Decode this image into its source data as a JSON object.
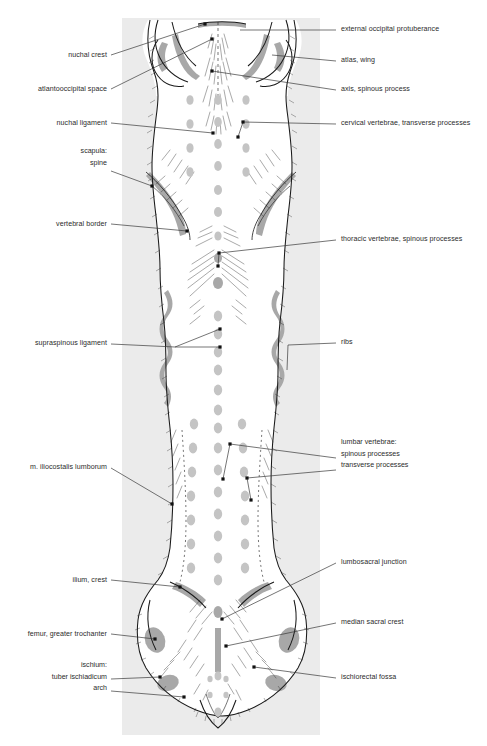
{
  "figure": {
    "panel": {
      "background_color": "#ebebeb",
      "x": 122,
      "y": 18,
      "width": 198,
      "height": 717
    },
    "colors": {
      "ink": "#1a1a1a",
      "leader_line": "#3a3a3a",
      "bone_highlight": "#a8a8a8",
      "palpation_dot": "#c4c4c4",
      "label_text": "#2b2b2b",
      "page_background": "#ffffff"
    }
  },
  "labels_left": [
    {
      "id": "nuchal-crest",
      "text": "nuchal crest",
      "x": 107,
      "y": 58,
      "leader": [
        [
          111,
          55
        ],
        [
          205,
          24
        ]
      ],
      "dot": true
    },
    {
      "id": "atlantooccipital-space",
      "text": "atlantooccipital space",
      "x": 107,
      "y": 92,
      "leader": [
        [
          111,
          89
        ],
        [
          212,
          39
        ]
      ],
      "dot": true
    },
    {
      "id": "nuchal-ligament",
      "text": "nuchal ligament",
      "x": 107,
      "y": 126,
      "leader": [
        [
          111,
          123
        ],
        [
          213,
          133
        ]
      ],
      "dot": true
    },
    {
      "id": "scapula-spine",
      "lines": [
        "scapula:",
        "spine"
      ],
      "x": 107,
      "y": 152,
      "leader": [
        [
          111,
          171
        ],
        [
          152,
          186
        ]
      ],
      "dot": true
    },
    {
      "id": "vertebral-border",
      "text": "vertebral border",
      "x": 107,
      "y": 227,
      "leader": [
        [
          111,
          224
        ],
        [
          187,
          231
        ]
      ],
      "dot": true
    },
    {
      "id": "supraspinous-ligament",
      "text": "supraspinous ligament",
      "x": 107,
      "y": 343,
      "leader": [
        [
          111,
          344
        ],
        [
          170,
          347
        ],
        [
          220,
          329
        ]
      ],
      "dot": true
    },
    {
      "id": "supraspinous-ligament-2",
      "text": "",
      "x": 0,
      "y": 0,
      "leader": [
        [
          170,
          347
        ],
        [
          220,
          347
        ]
      ],
      "dot": true
    },
    {
      "id": "m-iliocostalis-lumborum",
      "text": "m. iliocostalis lumborum",
      "x": 107,
      "y": 470,
      "leader": [
        [
          111,
          468
        ],
        [
          172,
          504
        ]
      ],
      "dot": true
    },
    {
      "id": "ilium-crest",
      "text": "ilium, crest",
      "x": 107,
      "y": 583,
      "leader": [
        [
          111,
          580
        ],
        [
          180,
          587
        ]
      ],
      "dot": true
    },
    {
      "id": "femur-greater-trochanter",
      "text": "femur, greater trochanter",
      "x": 107,
      "y": 637,
      "leader": [
        [
          111,
          634
        ],
        [
          155,
          639
        ]
      ],
      "dot": true
    },
    {
      "id": "ischium-group",
      "lines": [
        "ischium:",
        "tuber ischiadicum",
        "arch"
      ],
      "x": 107,
      "y": 664,
      "leader": [
        [
          111,
          679
        ],
        [
          160,
          677
        ]
      ],
      "dot": true
    },
    {
      "id": "ischium-arch",
      "text": "",
      "x": 0,
      "y": 0,
      "leader": [
        [
          111,
          691
        ],
        [
          182,
          697
        ]
      ],
      "dot": true
    }
  ],
  "labels_right": [
    {
      "id": "external-occipital-protuberance",
      "text": "external occipital protuberance",
      "x": 341,
      "y": 32,
      "leader": [
        [
          336,
          30
        ],
        [
          240,
          30
        ]
      ],
      "dot": false
    },
    {
      "id": "atlas-wing",
      "text": "atlas, wing",
      "x": 341,
      "y": 63,
      "leader": [
        [
          336,
          61
        ],
        [
          270,
          55
        ]
      ],
      "dot": false
    },
    {
      "id": "axis-spinous-process",
      "text": "axis, spinous process",
      "x": 341,
      "y": 92,
      "leader": [
        [
          336,
          90
        ],
        [
          212,
          71
        ]
      ],
      "dot": true
    },
    {
      "id": "cervical-vertebrae-transverse-processes",
      "text": "cervical vertebrae, transverse processes",
      "x": 341,
      "y": 126,
      "leader": [
        [
          336,
          124
        ],
        [
          243,
          122
        ]
      ],
      "dot": true
    },
    {
      "id": "cervical-vertebrae-2",
      "text": "",
      "x": 0,
      "y": 0,
      "leader": [
        [
          243,
          122
        ],
        [
          238,
          137
        ]
      ],
      "dot": true
    },
    {
      "id": "thoracic-vertebrae-spinous-processes",
      "text": "thoracic vertebrae, spinous processes",
      "x": 341,
      "y": 242,
      "leader": [
        [
          336,
          240
        ],
        [
          219,
          253
        ]
      ],
      "dot": true
    },
    {
      "id": "thoracic-vertebrae-2",
      "text": "",
      "x": 0,
      "y": 0,
      "leader": [
        [
          219,
          253
        ],
        [
          218,
          266
        ]
      ],
      "dot": true
    },
    {
      "id": "ribs",
      "text": "ribs",
      "x": 341,
      "y": 345,
      "leader": [
        [
          336,
          343
        ],
        [
          285,
          345
        ]
      ],
      "dot": false
    },
    {
      "id": "ribs-2",
      "text": "",
      "x": 0,
      "y": 0,
      "leader": [
        [
          285,
          345
        ],
        [
          287,
          368
        ]
      ],
      "dot": false
    },
    {
      "id": "lumbar-vertebrae-group",
      "lines": [
        "lumbar vertebrae:",
        "spinous processes",
        "transverse processes"
      ],
      "x": 341,
      "y": 441,
      "leader": [
        [
          336,
          458
        ],
        [
          230,
          444
        ]
      ],
      "dot": true
    },
    {
      "id": "lumbar-spinous-2",
      "text": "",
      "x": 0,
      "y": 0,
      "leader": [
        [
          230,
          444
        ],
        [
          223,
          479
        ]
      ],
      "dot": true
    },
    {
      "id": "lumbar-transverse",
      "text": "",
      "x": 0,
      "y": 0,
      "leader": [
        [
          336,
          470
        ],
        [
          247,
          478
        ]
      ],
      "dot": true
    },
    {
      "id": "lumbar-transverse-2",
      "text": "",
      "x": 0,
      "y": 0,
      "leader": [
        [
          247,
          478
        ],
        [
          251,
          500
        ]
      ],
      "dot": true
    },
    {
      "id": "lumbosacral-junction",
      "text": "lumbosacral junction",
      "x": 341,
      "y": 565,
      "leader": [
        [
          336,
          563
        ],
        [
          222,
          619
        ]
      ],
      "dot": true
    },
    {
      "id": "median-sacral-crest",
      "text": "median sacral crest",
      "x": 341,
      "y": 625,
      "leader": [
        [
          336,
          623
        ],
        [
          226,
          646
        ]
      ],
      "dot": true
    },
    {
      "id": "ischiorectal-fossa",
      "text": "ischiorectal fossa",
      "x": 341,
      "y": 680,
      "leader": [
        [
          336,
          678
        ],
        [
          254,
          667
        ]
      ],
      "dot": true
    }
  ],
  "palpation_dots": {
    "description": "Gray oval palpation markers over the vertebral column and paraspinal regions",
    "radius_x": 4.2,
    "radius_y": 5.4,
    "color": "#c4c4c4",
    "midline": [
      [
        218,
        100
      ],
      [
        218,
        119
      ],
      [
        218,
        140
      ],
      [
        218,
        160
      ],
      [
        218,
        183
      ],
      [
        218,
        203
      ],
      [
        218,
        226
      ],
      [
        218,
        248
      ],
      [
        218,
        270
      ],
      [
        218,
        292
      ],
      [
        218,
        312
      ],
      [
        218,
        330
      ],
      [
        218,
        347
      ],
      [
        218,
        366
      ],
      [
        218,
        385
      ],
      [
        218,
        404
      ],
      [
        218,
        424
      ],
      [
        218,
        443
      ],
      [
        218,
        462
      ],
      [
        218,
        481
      ],
      [
        218,
        500
      ],
      [
        218,
        520
      ],
      [
        218,
        540
      ],
      [
        218,
        560
      ],
      [
        218,
        580
      ],
      [
        218,
        600
      ],
      [
        218,
        620
      ],
      [
        218,
        640
      ],
      [
        218,
        660
      ],
      [
        218,
        678
      ],
      [
        218,
        694
      ],
      [
        218,
        712
      ]
    ],
    "left_column": [
      [
        190,
        100
      ],
      [
        190,
        123
      ],
      [
        190,
        146
      ],
      [
        190,
        170
      ],
      [
        195,
        424
      ],
      [
        193,
        444
      ],
      [
        192,
        466
      ],
      [
        191,
        488
      ],
      [
        191,
        510
      ],
      [
        191,
        532
      ],
      [
        191,
        554
      ]
    ],
    "right_column": [
      [
        246,
        100
      ],
      [
        246,
        123
      ],
      [
        246,
        146
      ],
      [
        246,
        170
      ],
      [
        244,
        424
      ],
      [
        245,
        444
      ],
      [
        246,
        466
      ],
      [
        247,
        488
      ],
      [
        247,
        510
      ],
      [
        247,
        532
      ],
      [
        247,
        538
      ]
    ],
    "small_pelvic": [
      [
        211,
        678
      ],
      [
        225,
        678
      ],
      [
        211,
        694
      ],
      [
        225,
        694
      ]
    ]
  },
  "bone_highlights": {
    "description": "Gray shaded bands marking palpable bony landmarks",
    "color": "#a8a8a8",
    "regions": [
      "nuchal crest arc",
      "atlas wings",
      "scapular spines",
      "thoracic spinous row",
      "rib arcs left and right",
      "iliac crests",
      "greater trochanters",
      "ischial tuberosities",
      "median sacral crest"
    ]
  }
}
